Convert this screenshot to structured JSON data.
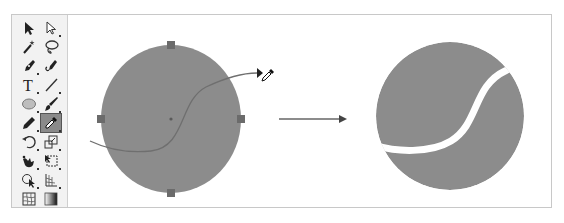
{
  "toolbar": {
    "tools": [
      {
        "name": "selection-tool",
        "row": 0,
        "col": 0
      },
      {
        "name": "direct-selection-tool",
        "row": 0,
        "col": 1
      },
      {
        "name": "magic-wand-tool",
        "row": 1,
        "col": 0
      },
      {
        "name": "lasso-tool",
        "row": 1,
        "col": 1
      },
      {
        "name": "pen-tool",
        "row": 2,
        "col": 0
      },
      {
        "name": "curvature-tool",
        "row": 2,
        "col": 1
      },
      {
        "name": "type-tool",
        "row": 3,
        "col": 0
      },
      {
        "name": "line-segment-tool",
        "row": 3,
        "col": 1
      },
      {
        "name": "ellipse-tool",
        "row": 4,
        "col": 0
      },
      {
        "name": "paintbrush-tool",
        "row": 4,
        "col": 1
      },
      {
        "name": "pencil-tool",
        "row": 5,
        "col": 0
      },
      {
        "name": "eyedropper-tool",
        "row": 5,
        "col": 1,
        "selected": true
      },
      {
        "name": "rotate-tool",
        "row": 6,
        "col": 0
      },
      {
        "name": "scale-tool",
        "row": 6,
        "col": 1
      },
      {
        "name": "warp-tool",
        "row": 7,
        "col": 0
      },
      {
        "name": "free-transform-tool",
        "row": 7,
        "col": 1
      },
      {
        "name": "shape-builder-tool",
        "row": 8,
        "col": 0
      },
      {
        "name": "perspective-grid-tool",
        "row": 8,
        "col": 1
      },
      {
        "name": "mesh-tool",
        "row": 9,
        "col": 0
      },
      {
        "name": "gradient-tool",
        "row": 9,
        "col": 1
      }
    ],
    "type_glyph": "T"
  },
  "canvas": {
    "colors": {
      "shape_fill": "#8c8c8c",
      "path_stroke": "#6f6f6f",
      "handle": "#6b6b6b",
      "arrow": "#555555"
    },
    "before": {
      "label": "circle-with-path"
    },
    "after": {
      "label": "tennis-ball-shape"
    }
  }
}
